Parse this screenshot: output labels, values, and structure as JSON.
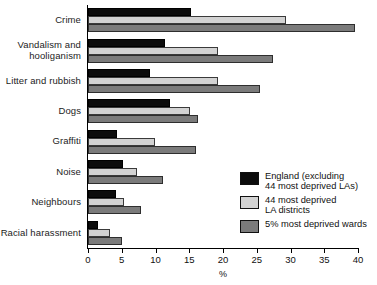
{
  "chart_data": {
    "type": "bar",
    "orientation": "horizontal",
    "title": "",
    "xlabel": "%",
    "ylabel": "",
    "xlim": [
      0,
      40
    ],
    "xticks": [
      0,
      5,
      10,
      15,
      20,
      25,
      30,
      35,
      40
    ],
    "xtick_labels": [
      "0",
      "5",
      "10",
      "15",
      "20",
      "25",
      "30",
      "35",
      "40"
    ],
    "grid": false,
    "legend_position": "center-right",
    "categories": [
      "Crime",
      "Vandalism and\nhooliganism",
      "Litter and rubbish",
      "Dogs",
      "Graffiti",
      "Noise",
      "Neighbours",
      "Racial harassment"
    ],
    "series": [
      {
        "name": "England (excluding\n44 most deprived LAs)",
        "color": "#0c0c0c",
        "values": [
          15.3,
          11.4,
          9.2,
          12.1,
          4.3,
          5.2,
          4.1,
          1.5
        ]
      },
      {
        "name": "44 most deprived\nLA districts",
        "color": "#d2d2d2",
        "values": [
          29.3,
          19.3,
          19.3,
          15.1,
          9.9,
          7.3,
          5.3,
          3.3
        ]
      },
      {
        "name": "5% most deprived wards",
        "color": "#7b7b7b",
        "values": [
          39.6,
          27.4,
          25.5,
          16.3,
          16.0,
          11.1,
          7.9,
          5.0
        ]
      }
    ]
  },
  "legend": {
    "items": [
      {
        "label": "England (excluding\n44 most deprived LAs)",
        "swatch": "s0"
      },
      {
        "label": "44 most deprived\nLA districts",
        "swatch": "s1"
      },
      {
        "label": "5% most deprived wards",
        "swatch": "s2"
      }
    ]
  }
}
